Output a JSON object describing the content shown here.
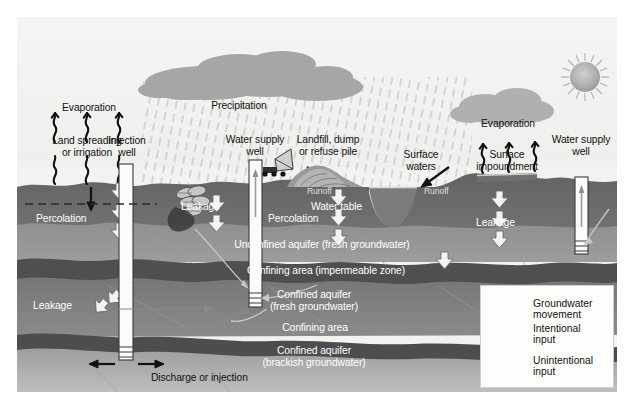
{
  "diagram": {
    "background_color": "#f2f2f0"
  },
  "sky": {
    "sun": "sun-icon",
    "clouds": [
      "cloud-left",
      "cloud-right"
    ],
    "precipitation_hatch": "rain-hatch"
  },
  "labels": {
    "evaporation_left": "Evaporation",
    "precipitation": "Precipitation",
    "land_spreading": "Land spreading\nor irrigation",
    "injection_well": "Injection\nwell",
    "water_supply_well_left": "Water supply\nwell",
    "landfill": "Landfill, dump\nor refuse pile",
    "surface_waters": "Surface\nwaters",
    "evaporation_right": "Evaporation",
    "surface_impoundment": "Surface\nimpoundment",
    "water_supply_well_right": "Water supply\nwell",
    "percolation_left": "Percolation",
    "percolation_mid": "Percolation",
    "leakage_upper": "Leakage",
    "leakage_left": "Leakage",
    "leakage_right": "Leakage",
    "runoff_left": "Runoff",
    "runoff_right": "Runoff",
    "water_table": "Water table",
    "discharge": "Discharge or injection"
  },
  "strata": [
    {
      "id": "unconfined",
      "label": "Unconfined aquifer (fresh groundwater)",
      "color": "#8d8d8d"
    },
    {
      "id": "confining-1",
      "label": "Confining area (impermeable zone)",
      "color": "#5d5d5d"
    },
    {
      "id": "confined-fresh",
      "label": "Confined aquifer\n(fresh groundwater)",
      "color": "#7c7c7c"
    },
    {
      "id": "confining-2",
      "label": "Confining area",
      "color": "#5a5a5a"
    },
    {
      "id": "confined-brackish",
      "label": "Confined aquifer\n(brackish groundwater)",
      "color": "#a3a3a3"
    }
  ],
  "strata_labels": {
    "unconfined": "Unconfined aquifer (fresh groundwater)",
    "confining_1": "Confining area (impermeable zone)",
    "confined_fresh": "Confined aquifer",
    "confined_fresh_2": "(fresh groundwater)",
    "confining_2": "Confining area",
    "confined_brackish": "Confined aquifer",
    "confined_brackish_2": "(brackish groundwater)"
  },
  "legend": {
    "entries": [
      {
        "icon": "curved-arrow-icon",
        "line1": "Groundwater",
        "line2": "movement"
      },
      {
        "icon": "straight-arrow-icon",
        "line1": "Intentional",
        "line2": "input"
      },
      {
        "icon": "hollow-arrows-icon",
        "line1": "Unintentional",
        "line2": "input"
      }
    ]
  },
  "colors": {
    "soil_top": "#6b6b6b",
    "unconfined": "#8d8d8d",
    "confining": "#555555",
    "confined_fresh": "#7e7e7e",
    "confined_brackish": "#a6a6a6",
    "sky": "#f2f2f0",
    "cloud": "#a9a9a9",
    "sun": "#a8a8a8",
    "arrow_dark": "#161616",
    "arrow_hollow": "#f4f4f2",
    "text_dark": "#121212",
    "text_light": "#ffffff"
  }
}
